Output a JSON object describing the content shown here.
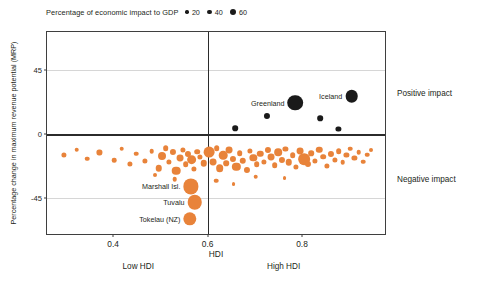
{
  "legend": {
    "title": "Percentage of economic impact to GDP",
    "items": [
      {
        "label": "20",
        "size": 3.4
      },
      {
        "label": "40",
        "size": 4.8
      },
      {
        "label": "60",
        "size": 6.4
      }
    ]
  },
  "axes": {
    "ylabel": "Percentage change in maximum revenue potential (MRP)",
    "xlabel": "HDI",
    "yticks": [
      "45",
      "0",
      "-45"
    ],
    "xticks": [
      "0.4",
      "0.6",
      "0.8"
    ]
  },
  "annotations": {
    "low_hdi": "Low HDI",
    "high_hdi": "High HDI",
    "positive_impact": "Positive impact",
    "negative_impact": "Negative impact"
  },
  "chart_data": {
    "type": "scatter",
    "title": "",
    "xlabel": "HDI",
    "ylabel": "Percentage change in maximum revenue potential (MRP)",
    "xlim": [
      0.26,
      0.98
    ],
    "ylim": [
      -72,
      72
    ],
    "xticks": [
      0.4,
      0.6,
      0.8
    ],
    "yticks": [
      45,
      0,
      -45
    ],
    "grid": true,
    "gridlines_y": [
      45,
      -45
    ],
    "zero_line_y": 0,
    "vertical_divider_x": 0.6,
    "size_legend": {
      "title": "Percentage of economic impact to GDP",
      "values": [
        20,
        40,
        60
      ],
      "color": "#1a1a1a"
    },
    "colors": {
      "positive": "#1a1a1a",
      "negative": "#e8833a",
      "frame": "#3f3f3f",
      "grid": "#d6d6d6"
    },
    "series": [
      {
        "name": "Positive impact",
        "color": "#1a1a1a",
        "points": [
          {
            "label": "Greenland",
            "x": 0.786,
            "y": 22.0,
            "size": 46
          },
          {
            "label": "Iceland",
            "x": 0.905,
            "y": 26.5,
            "size": 30
          },
          {
            "label": "",
            "x": 0.726,
            "y": 13.0,
            "size": 7
          },
          {
            "label": "",
            "x": 0.839,
            "y": 11.0,
            "size": 6
          },
          {
            "label": "",
            "x": 0.659,
            "y": 4.0,
            "size": 6
          },
          {
            "label": "",
            "x": 0.877,
            "y": 3.5,
            "size": 5
          }
        ]
      },
      {
        "name": "Negative impact",
        "color": "#e8833a",
        "points": [
          {
            "label": "Marshall Isl.",
            "x": 0.565,
            "y": -37.0,
            "size": 44
          },
          {
            "label": "Tuvalu",
            "x": 0.573,
            "y": -48.0,
            "size": 40
          },
          {
            "label": "Tokelau (NZ)",
            "x": 0.563,
            "y": -60.0,
            "size": 34
          },
          {
            "label": "",
            "x": 0.296,
            "y": -14.5,
            "size": 5
          },
          {
            "label": "",
            "x": 0.323,
            "y": -11.0,
            "size": 4
          },
          {
            "label": "",
            "x": 0.345,
            "y": -17.5,
            "size": 4
          },
          {
            "label": "",
            "x": 0.371,
            "y": -13.0,
            "size": 5
          },
          {
            "label": "",
            "x": 0.402,
            "y": -18.5,
            "size": 4
          },
          {
            "label": "",
            "x": 0.418,
            "y": -10.5,
            "size": 4
          },
          {
            "label": "",
            "x": 0.436,
            "y": -21.0,
            "size": 5
          },
          {
            "label": "",
            "x": 0.449,
            "y": -14.0,
            "size": 4
          },
          {
            "label": "",
            "x": 0.468,
            "y": -19.0,
            "size": 5
          },
          {
            "label": "",
            "x": 0.482,
            "y": -12.0,
            "size": 4
          },
          {
            "label": "",
            "x": 0.497,
            "y": -24.0,
            "size": 8
          },
          {
            "label": "",
            "x": 0.503,
            "y": -15.5,
            "size": 12
          },
          {
            "label": "",
            "x": 0.511,
            "y": -10.0,
            "size": 6
          },
          {
            "label": "",
            "x": 0.519,
            "y": -20.0,
            "size": 5
          },
          {
            "label": "",
            "x": 0.526,
            "y": -13.0,
            "size": 7
          },
          {
            "label": "",
            "x": 0.534,
            "y": -26.0,
            "size": 14
          },
          {
            "label": "",
            "x": 0.541,
            "y": -17.0,
            "size": 9
          },
          {
            "label": "",
            "x": 0.548,
            "y": -11.0,
            "size": 5
          },
          {
            "label": "",
            "x": 0.554,
            "y": -21.5,
            "size": 6
          },
          {
            "label": "",
            "x": 0.559,
            "y": -14.0,
            "size": 7
          },
          {
            "label": "",
            "x": 0.566,
            "y": -18.0,
            "size": 18
          },
          {
            "label": "",
            "x": 0.572,
            "y": -24.5,
            "size": 5
          },
          {
            "label": "",
            "x": 0.578,
            "y": -12.5,
            "size": 6
          },
          {
            "label": "",
            "x": 0.584,
            "y": -16.0,
            "size": 5
          },
          {
            "label": "",
            "x": 0.592,
            "y": -20.5,
            "size": 8
          },
          {
            "label": "",
            "x": 0.604,
            "y": -13.0,
            "size": 22
          },
          {
            "label": "",
            "x": 0.612,
            "y": -19.5,
            "size": 9
          },
          {
            "label": "",
            "x": 0.619,
            "y": -10.0,
            "size": 6
          },
          {
            "label": "",
            "x": 0.626,
            "y": -24.0,
            "size": 11
          },
          {
            "label": "",
            "x": 0.633,
            "y": -15.0,
            "size": 14
          },
          {
            "label": "",
            "x": 0.639,
            "y": -20.5,
            "size": 6
          },
          {
            "label": "",
            "x": 0.646,
            "y": -11.5,
            "size": 9
          },
          {
            "label": "",
            "x": 0.653,
            "y": -17.5,
            "size": 7
          },
          {
            "label": "",
            "x": 0.661,
            "y": -23.0,
            "size": 13
          },
          {
            "label": "",
            "x": 0.668,
            "y": -13.5,
            "size": 6
          },
          {
            "label": "",
            "x": 0.675,
            "y": -19.0,
            "size": 8
          },
          {
            "label": "",
            "x": 0.683,
            "y": -25.5,
            "size": 7
          },
          {
            "label": "",
            "x": 0.69,
            "y": -12.0,
            "size": 5
          },
          {
            "label": "",
            "x": 0.697,
            "y": -17.0,
            "size": 10
          },
          {
            "label": "",
            "x": 0.704,
            "y": -21.5,
            "size": 6
          },
          {
            "label": "",
            "x": 0.712,
            "y": -14.0,
            "size": 8
          },
          {
            "label": "",
            "x": 0.719,
            "y": -19.5,
            "size": 5
          },
          {
            "label": "",
            "x": 0.727,
            "y": -11.0,
            "size": 7
          },
          {
            "label": "",
            "x": 0.734,
            "y": -16.5,
            "size": 9
          },
          {
            "label": "",
            "x": 0.742,
            "y": -22.0,
            "size": 6
          },
          {
            "label": "",
            "x": 0.75,
            "y": -13.0,
            "size": 11
          },
          {
            "label": "",
            "x": 0.757,
            "y": -18.0,
            "size": 7
          },
          {
            "label": "",
            "x": 0.765,
            "y": -10.5,
            "size": 5
          },
          {
            "label": "",
            "x": 0.772,
            "y": -20.0,
            "size": 8
          },
          {
            "label": "",
            "x": 0.78,
            "y": -15.0,
            "size": 6
          },
          {
            "label": "",
            "x": 0.788,
            "y": -23.0,
            "size": 5
          },
          {
            "label": "",
            "x": 0.796,
            "y": -12.0,
            "size": 9
          },
          {
            "label": "",
            "x": 0.804,
            "y": -17.5,
            "size": 26
          },
          {
            "label": "",
            "x": 0.812,
            "y": -21.0,
            "size": 7
          },
          {
            "label": "",
            "x": 0.82,
            "y": -13.5,
            "size": 6
          },
          {
            "label": "",
            "x": 0.828,
            "y": -19.0,
            "size": 5
          },
          {
            "label": "",
            "x": 0.836,
            "y": -11.0,
            "size": 8
          },
          {
            "label": "",
            "x": 0.845,
            "y": -16.0,
            "size": 6
          },
          {
            "label": "",
            "x": 0.853,
            "y": -22.5,
            "size": 5
          },
          {
            "label": "",
            "x": 0.861,
            "y": -14.0,
            "size": 7
          },
          {
            "label": "",
            "x": 0.869,
            "y": -18.5,
            "size": 5
          },
          {
            "label": "",
            "x": 0.878,
            "y": -12.0,
            "size": 6
          },
          {
            "label": "",
            "x": 0.886,
            "y": -20.0,
            "size": 4
          },
          {
            "label": "",
            "x": 0.894,
            "y": -15.0,
            "size": 5
          },
          {
            "label": "",
            "x": 0.902,
            "y": -10.5,
            "size": 4
          },
          {
            "label": "",
            "x": 0.911,
            "y": -17.0,
            "size": 5
          },
          {
            "label": "",
            "x": 0.92,
            "y": -13.0,
            "size": 4
          },
          {
            "label": "",
            "x": 0.929,
            "y": -19.5,
            "size": 4
          },
          {
            "label": "",
            "x": 0.938,
            "y": -14.5,
            "size": 4
          },
          {
            "label": "",
            "x": 0.947,
            "y": -11.0,
            "size": 3
          },
          {
            "label": "",
            "x": 0.618,
            "y": -33.0,
            "size": 4
          },
          {
            "label": "",
            "x": 0.702,
            "y": -30.0,
            "size": 4
          },
          {
            "label": "",
            "x": 0.655,
            "y": -35.5,
            "size": 3
          },
          {
            "label": "",
            "x": 0.763,
            "y": -31.0,
            "size": 3
          },
          {
            "label": "",
            "x": 0.53,
            "y": -32.0,
            "size": 4
          },
          {
            "label": "",
            "x": 0.488,
            "y": -29.0,
            "size": 3
          }
        ]
      }
    ]
  }
}
